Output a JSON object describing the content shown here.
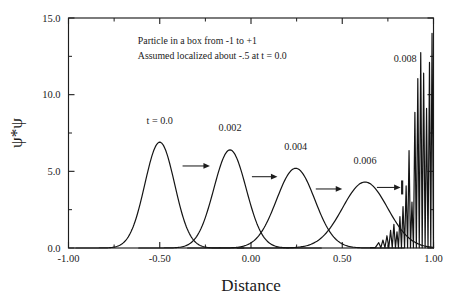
{
  "figure": {
    "annotation_lines": [
      "Particle in a box from -1 to +1",
      "Assumed localized about -.5 at t = 0.0"
    ]
  },
  "chart_data": {
    "type": "line",
    "title": "",
    "xlabel": "Distance",
    "ylabel": "ψ*ψ",
    "xlim": [
      -1.0,
      1.0
    ],
    "ylim": [
      0.0,
      15.0
    ],
    "xticks": [
      -1.0,
      -0.5,
      0.0,
      0.5,
      1.0
    ],
    "xtick_labels": [
      "-1.00",
      "-0.50",
      "0.00",
      "0.50",
      "1.00"
    ],
    "yticks": [
      0.0,
      5.0,
      10.0,
      15.0
    ],
    "ytick_labels": [
      "0.0",
      "5.0",
      "10.0",
      "15.0"
    ],
    "xminor_ticks": [
      -0.75,
      -0.25,
      0.25,
      0.75
    ],
    "yminor_ticks": [
      2.5,
      7.5,
      12.5
    ],
    "grid": false,
    "legend_position": "none",
    "annotations": [
      {
        "label": "Particle in a box from -1 to +1",
        "x": -0.62,
        "y": 13.3
      },
      {
        "label": "Assumed localized about -.5 at t = 0.0",
        "x": -0.62,
        "y": 12.3
      }
    ],
    "series": [
      {
        "name": "t = 0.0",
        "label": "t = 0.0",
        "label_x": -0.5,
        "label_y": 8.1,
        "peak_x": -0.5,
        "peak_y": 6.9,
        "width": 0.115
      },
      {
        "name": "0.002",
        "label": "0.002",
        "label_x": -0.115,
        "label_y": 7.6,
        "peak_x": -0.115,
        "peak_y": 6.4,
        "width": 0.125
      },
      {
        "name": "0.004",
        "label": "0.004",
        "label_x": 0.245,
        "label_y": 6.4,
        "peak_x": 0.245,
        "peak_y": 5.2,
        "width": 0.148
      },
      {
        "name": "0.006",
        "label": "0.006",
        "label_x": 0.625,
        "label_y": 5.5,
        "peak_x": 0.625,
        "peak_y": 4.3,
        "width": 0.175
      },
      {
        "name": "0.008",
        "label": "0.008",
        "label_x": 0.845,
        "label_y": 12.1,
        "peak_x": 0.99,
        "peak_y": 14.0,
        "description": "rapidly oscillating spikes piling up at the x = 1.00 wall"
      }
    ],
    "arrows": [
      {
        "from_x": -0.375,
        "to_x": -0.225,
        "y": 5.35
      },
      {
        "from_x": 0.005,
        "to_x": 0.145,
        "y": 4.65
      },
      {
        "from_x": 0.355,
        "to_x": 0.5,
        "y": 3.85
      },
      {
        "from_x": 0.69,
        "to_x": 0.82,
        "y": 3.95
      }
    ],
    "oscillation_peaks": [
      {
        "x": 0.7,
        "y": 0.35
      },
      {
        "x": 0.723,
        "y": 0.52
      },
      {
        "x": 0.745,
        "y": 0.8
      },
      {
        "x": 0.765,
        "y": 1.15
      },
      {
        "x": 0.783,
        "y": 1.55
      },
      {
        "x": 0.8,
        "y": 1.05
      },
      {
        "x": 0.816,
        "y": 2.05
      },
      {
        "x": 0.833,
        "y": 2.7
      },
      {
        "x": 0.85,
        "y": 4.05
      },
      {
        "x": 0.866,
        "y": 6.35
      },
      {
        "x": 0.882,
        "y": 3.0
      },
      {
        "x": 0.898,
        "y": 8.85
      },
      {
        "x": 0.914,
        "y": 11.05
      },
      {
        "x": 0.93,
        "y": 12.75
      },
      {
        "x": 0.946,
        "y": 11.4
      },
      {
        "x": 0.962,
        "y": 9.1
      },
      {
        "x": 0.978,
        "y": 12.1
      },
      {
        "x": 0.992,
        "y": 14.0
      }
    ]
  }
}
